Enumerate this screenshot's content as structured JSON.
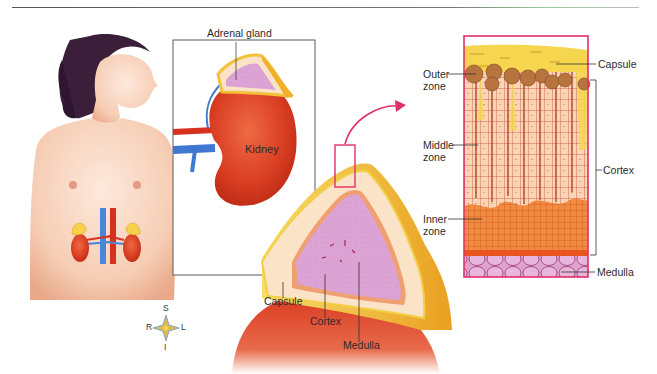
{
  "figure": {
    "panels": [
      {
        "id": "body",
        "description": "Female torso showing kidneys and adrenal glands"
      },
      {
        "id": "kidney-inset",
        "description": "Kidney with adrenal gland on top"
      },
      {
        "id": "gland-section",
        "description": "Cross-section of adrenal gland"
      },
      {
        "id": "histology",
        "description": "Magnified tissue layers of adrenal gland"
      }
    ]
  },
  "labels": {
    "adrenal_gland": "Adrenal gland",
    "kidney": "Kidney",
    "section_capsule": "Capsule",
    "section_cortex": "Cortex",
    "section_medulla": "Medulla",
    "histo_capsule": "Capsule",
    "histo_cortex": "Cortex",
    "histo_medulla": "Medulla",
    "outer_zone_1": "Outer",
    "outer_zone_2": "zone",
    "middle_zone_1": "Middle",
    "middle_zone_2": "zone",
    "inner_zone_1": "Inner",
    "inner_zone_2": "zone"
  },
  "compass": {
    "superior": "S",
    "inferior": "I",
    "right": "R",
    "left": "L"
  },
  "colors": {
    "highlight_box": "#e0306a",
    "kidney_red": "#d8391f",
    "capsule_yellow": "#f3d34a",
    "cortex_peach": "#fbe3c8",
    "medulla_pink": "#dca0d0",
    "inner_zone_orange": "#f08a3c",
    "vein_blue": "#3f78d0",
    "artery_red": "#d7301f"
  }
}
